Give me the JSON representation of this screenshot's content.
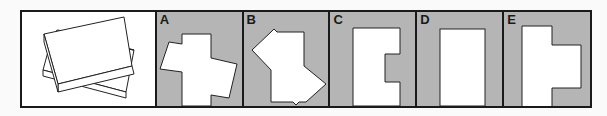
{
  "puzzle": {
    "reference": {
      "name": "stacked-boxes",
      "description": "two overlapping rectangular boxes"
    },
    "options": [
      {
        "label": "A",
        "shape": "rotated-cross"
      },
      {
        "label": "B",
        "shape": "irregular-polygon"
      },
      {
        "label": "C",
        "shape": "c-shape"
      },
      {
        "label": "D",
        "shape": "rectangle"
      },
      {
        "label": "E",
        "shape": "t-shape"
      }
    ]
  },
  "colors": {
    "panel_gray": "#b5b5b5",
    "border": "#1a1a1a",
    "shape_fill": "#ffffff"
  }
}
